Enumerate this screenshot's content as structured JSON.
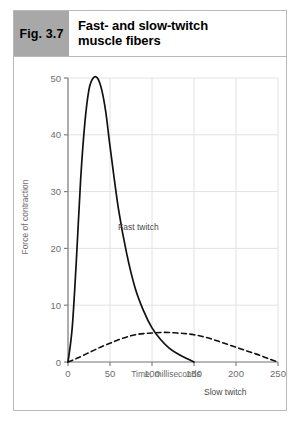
{
  "figure": {
    "number_label": "Fig. 3.7",
    "title_line1": "Fast- and slow-twitch",
    "title_line2": "muscle fibers",
    "number_box_color": "#a8a8a8",
    "border_color": "#b9b9b9"
  },
  "chart_data": {
    "type": "line",
    "title": "",
    "xlabel": "Time, milliseconds",
    "ylabel": "Force of contraction",
    "xlim": [
      0,
      250
    ],
    "ylim": [
      0,
      50
    ],
    "xticks": [
      "0",
      "50",
      "100",
      "150",
      "200",
      "250"
    ],
    "yticks": [
      "0",
      "10",
      "20",
      "30",
      "40",
      "50"
    ],
    "grid": "both",
    "grid_color": "#e2e2e2",
    "axis_color": "#808080",
    "legend_position": "inline-annotations",
    "series": [
      {
        "name": "Fast twitch",
        "style": "solid",
        "color": "#111111",
        "annotation": "Fast twitch",
        "x": [
          0,
          5,
          10,
          15,
          20,
          25,
          30,
          35,
          40,
          45,
          50,
          60,
          70,
          80,
          90,
          100,
          110,
          120,
          130,
          140,
          150
        ],
        "y": [
          0,
          6,
          18,
          32,
          42,
          48,
          50,
          50,
          48,
          44,
          38,
          27,
          19,
          13,
          9,
          6,
          4,
          2.5,
          1.5,
          0.7,
          0
        ]
      },
      {
        "name": "Slow twitch",
        "style": "dashed",
        "color": "#111111",
        "annotation": "Slow twitch",
        "x": [
          0,
          10,
          20,
          30,
          40,
          50,
          60,
          70,
          80,
          90,
          100,
          110,
          120,
          130,
          140,
          150,
          160,
          170,
          180,
          190,
          200,
          210,
          220,
          230,
          240,
          250
        ],
        "y": [
          0,
          0.6,
          1.3,
          2.0,
          2.7,
          3.3,
          3.9,
          4.4,
          4.8,
          5.0,
          5.1,
          5.2,
          5.2,
          5.1,
          5.0,
          4.8,
          4.5,
          4.1,
          3.6,
          3.1,
          2.6,
          2.1,
          1.6,
          1.1,
          0.5,
          0
        ]
      }
    ]
  }
}
